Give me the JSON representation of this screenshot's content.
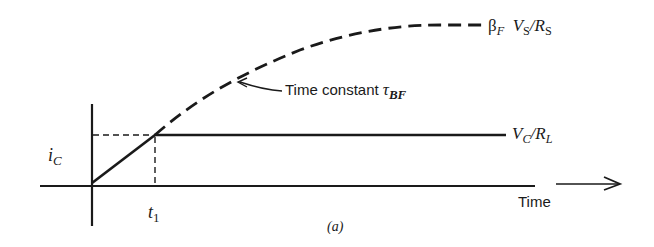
{
  "diagram": {
    "caption": "(a)",
    "axes": {
      "y_label_main": "i",
      "y_label_sub": "C",
      "x_tick_main": "t",
      "x_tick_sub": "1",
      "x_label": "Time"
    },
    "curves": {
      "saturation_asymptote": {
        "style": "dashed",
        "label_beta": "β",
        "label_beta_sub": "F",
        "label_v": "V",
        "label_v_sub": "S",
        "label_slash": "/",
        "label_r": "R",
        "label_r_sub": "S"
      },
      "collector_limit": {
        "style": "solid",
        "label_v": "V",
        "label_v_sub": "C",
        "label_slash": "/",
        "label_r": "R",
        "label_r_sub": "L"
      }
    },
    "annotation": {
      "text": "Time constant ",
      "tau": "τ",
      "tau_sub": "BF"
    },
    "colors": {
      "ink": "#1a1a1a",
      "background": "#ffffff"
    }
  }
}
